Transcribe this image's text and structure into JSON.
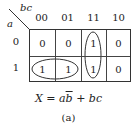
{
  "kmap": {
    "row_var": "a",
    "col_var": "bc",
    "col_headers": [
      "00",
      "01",
      "11",
      "10"
    ],
    "row_headers": [
      "0",
      "1"
    ],
    "cells": [
      [
        "0",
        "0",
        "1",
        "0"
      ],
      [
        "1",
        "1",
        "1",
        "0"
      ]
    ],
    "groups": [
      {
        "name": "ab-bar",
        "cells": [
          [
            1,
            0
          ],
          [
            1,
            1
          ]
        ],
        "shape": "horizontal-ellipse"
      },
      {
        "name": "bc",
        "cells": [
          [
            0,
            2
          ],
          [
            1,
            2
          ]
        ],
        "shape": "vertical-ellipse"
      }
    ]
  },
  "equation": {
    "lhs": "X",
    "eq": "=",
    "term1_a": "a",
    "term1_b": "b",
    "plus": "+",
    "term2": "bc"
  },
  "caption": "(a)"
}
